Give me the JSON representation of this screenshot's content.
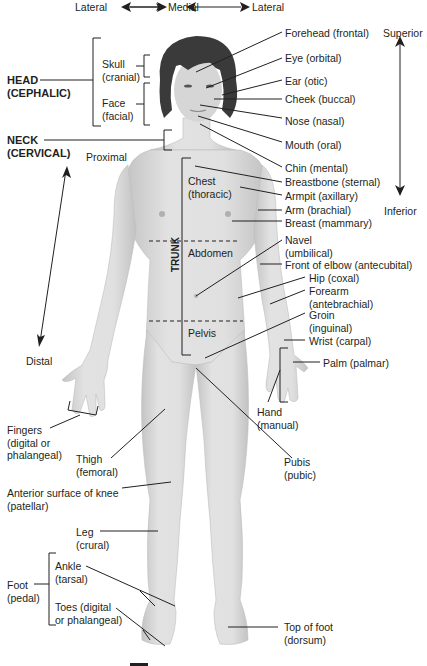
{
  "direction_labels": {
    "lateral_left": "Lateral",
    "medial": "Medial",
    "lateral_right": "Lateral",
    "superior": "Superior",
    "inferior": "Inferior",
    "proximal": "Proximal",
    "distal": "Distal"
  },
  "regions": {
    "head": [
      "HEAD",
      "(CEPHALIC)"
    ],
    "neck": [
      "NECK",
      "(CERVICAL)"
    ],
    "trunk": "TRUNK"
  },
  "left_labels": {
    "skull": [
      "Skull",
      "(cranial)"
    ],
    "face": [
      "Face",
      "(facial)"
    ],
    "fingers": [
      "Fingers",
      "(digital or",
      "phalangeal)"
    ],
    "thigh": [
      "Thigh",
      "(femoral)"
    ],
    "knee": [
      "Anterior surface of knee",
      "(patellar)"
    ],
    "leg": [
      "Leg",
      "(crural)"
    ],
    "foot": [
      "Foot",
      "(pedal)"
    ],
    "ankle": [
      "Ankle",
      "(tarsal)"
    ],
    "toes": [
      "Toes (digital",
      "or phalangeal)"
    ]
  },
  "trunk_labels": {
    "chest": [
      "Chest",
      "(thoracic)"
    ],
    "abdomen": "Abdomen",
    "pelvis": "Pelvis"
  },
  "right_labels": {
    "forehead": "Forehead (frontal)",
    "eye": "Eye (orbital)",
    "ear": "Ear (otic)",
    "cheek": "Cheek (buccal)",
    "nose": "Nose (nasal)",
    "mouth": "Mouth (oral)",
    "chin": "Chin (mental)",
    "breastbone": "Breastbone (sternal)",
    "armpit": "Armpit (axillary)",
    "arm": "Arm (brachial)",
    "breast": "Breast (mammary)",
    "navel": [
      "Navel",
      "(umbilical)"
    ],
    "elbow": "Front of elbow (antecubital)",
    "hip": "Hip (coxal)",
    "forearm": [
      "Forearm",
      "(antebrachial)"
    ],
    "groin": [
      "Groin",
      "(inguinal)"
    ],
    "wrist": "Wrist (carpal)",
    "palm": "Palm (palmar)",
    "hand": [
      "Hand",
      "(manual)"
    ],
    "pubis": [
      "Pubis",
      "(pubic)"
    ],
    "top_of_foot": [
      "Top of foot",
      "(dorsum)"
    ]
  },
  "colors": {
    "ink": "#231f20",
    "skin": "#d9d9d9",
    "skin_shade": "#b9b9b9",
    "hair": "#3a3a3a",
    "background": "#ffffff"
  }
}
